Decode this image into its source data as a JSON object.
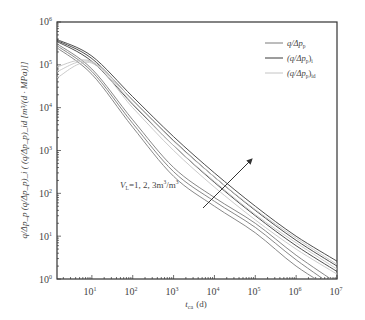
{
  "chart_data": {
    "type": "line",
    "title": "",
    "xlabel": "t_ca (d)",
    "ylabel": "q/Δp_p (q/Δp_p)_i ( (q/Δp_p)_id [m³/(d · MPa)]]",
    "xscale": "log",
    "yscale": "log",
    "xlim": [
      1.4,
      10000000
    ],
    "ylim": [
      1,
      1000000
    ],
    "x_ticks": [
      "10^1",
      "10^2",
      "10^3",
      "10^4",
      "10^5",
      "10^6",
      "10^7"
    ],
    "y_ticks": [
      "10^0",
      "10^1",
      "10^2",
      "10^3",
      "10^4",
      "10^5",
      "10^6"
    ],
    "grid": false,
    "legend_position": "upper right",
    "legend": [
      {
        "label": "q/Δp_p",
        "color": "#7a7a7a"
      },
      {
        "label": "(q/Δp_p)_i",
        "color": "#3a3a3a"
      },
      {
        "label": "(q/Δp_p)_id",
        "color": "#c4c4c4"
      }
    ],
    "annotation": {
      "text": "V_L=1, 2, 3m³/m³",
      "arrow": "increasing V_L direction"
    },
    "x": [
      1.4,
      10,
      100,
      1000,
      10000,
      100000,
      1000000,
      10000000
    ],
    "series": [
      {
        "name": "(q/Δp_p)_i V_L=1",
        "color": "#3a3a3a",
        "values": [
          350000,
          120000,
          12000,
          1300,
          180,
          30,
          6,
          1.5
        ]
      },
      {
        "name": "(q/Δp_p)_i V_L=2",
        "color": "#3a3a3a",
        "values": [
          370000,
          140000,
          15000,
          1700,
          240,
          40,
          8,
          2
        ]
      },
      {
        "name": "(q/Δp_p)_i V_L=3",
        "color": "#3a3a3a",
        "values": [
          390000,
          160000,
          18000,
          2100,
          300,
          50,
          10,
          2.6
        ]
      },
      {
        "name": "q/Δp_p V_L=1",
        "color": "#7a7a7a",
        "values": [
          250000,
          60000,
          3500,
          250,
          50,
          12,
          2,
          0.5
        ]
      },
      {
        "name": "q/Δp_p V_L=2",
        "color": "#7a7a7a",
        "values": [
          280000,
          70000,
          4300,
          320,
          65,
          16,
          2.8,
          0.6
        ]
      },
      {
        "name": "q/Δp_p V_L=3",
        "color": "#7a7a7a",
        "values": [
          310000,
          80000,
          5200,
          400,
          80,
          20,
          3.6,
          0.8
        ]
      },
      {
        "name": "(q/Δp_p)_id V_L=1",
        "color": "#c4c4c4",
        "values": [
          50000,
          110000,
          10000,
          1000,
          140,
          24,
          5,
          1.3
        ]
      },
      {
        "name": "(q/Δp_p)_id V_L=2",
        "color": "#c4c4c4",
        "values": [
          70000,
          115000,
          12500,
          1300,
          190,
          32,
          7,
          1.7
        ]
      },
      {
        "name": "(q/Δp_p)_id V_L=3",
        "color": "#c4c4c4",
        "values": [
          90000,
          120000,
          15000,
          1650,
          240,
          42,
          9,
          2.2
        ]
      }
    ]
  },
  "axes": {
    "x_ticks": [
      {
        "label": "10",
        "exp": "1"
      },
      {
        "label": "10",
        "exp": "2"
      },
      {
        "label": "10",
        "exp": "3"
      },
      {
        "label": "10",
        "exp": "4"
      },
      {
        "label": "10",
        "exp": "5"
      },
      {
        "label": "10",
        "exp": "6"
      },
      {
        "label": "10",
        "exp": "7"
      }
    ],
    "y_ticks": [
      {
        "label": "10",
        "exp": "0"
      },
      {
        "label": "10",
        "exp": "1"
      },
      {
        "label": "10",
        "exp": "2"
      },
      {
        "label": "10",
        "exp": "3"
      },
      {
        "label": "10",
        "exp": "4"
      },
      {
        "label": "10",
        "exp": "5"
      },
      {
        "label": "10",
        "exp": "6"
      }
    ],
    "xlabel_main": "t",
    "xlabel_sub": "ca",
    "xlabel_unit": "(d)",
    "ylabel": "q/Δp_p  (q/Δp_p)_i ( (q/Δp_p)_id [m³/(d · MPa)]]"
  },
  "legend": {
    "items": [
      {
        "text": "q/Δp",
        "sub": "p",
        "prefix": "",
        "suffix": ""
      },
      {
        "text": "(q/Δp",
        "sub": "p",
        "suffix": ")",
        "suffix_sub": "i"
      },
      {
        "text": "(q/Δp",
        "sub": "p",
        "suffix": ")",
        "suffix_sub": "id"
      }
    ]
  },
  "annotation": {
    "v": "V",
    "v_sub": "L",
    "text": "=1, 2, 3m",
    "sup1": "3",
    "slash": "/m",
    "sup2": "3"
  }
}
